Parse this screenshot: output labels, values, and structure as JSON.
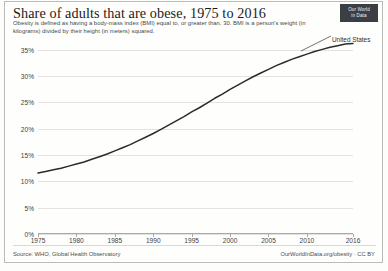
{
  "chart_data": {
    "type": "line",
    "title": "Share of adults that are obese, 1975 to 2016",
    "subtitle": "Obesity is defined as having a body-mass index (BMI) equal to, or greater than, 30. BMI is a person's weight (in kilograms) divided by their height (in meters) squared.",
    "xlabel": "",
    "ylabel": "",
    "xlim": [
      1975,
      2016
    ],
    "ylim": [
      0,
      36.5
    ],
    "grid": true,
    "legend_position": "inline-right-end",
    "x_tick_labels": [
      "1975",
      "1980",
      "1985",
      "1990",
      "1995",
      "2000",
      "2005",
      "2010",
      "2016"
    ],
    "x_ticks": [
      1975,
      1980,
      1985,
      1990,
      1995,
      2000,
      2005,
      2010,
      2016
    ],
    "y_tick_labels": [
      "0%",
      "5%",
      "10%",
      "15%",
      "20%",
      "25%",
      "30%",
      "35%"
    ],
    "y_ticks": [
      0,
      5,
      10,
      15,
      20,
      25,
      30,
      35
    ],
    "series": [
      {
        "name": "United States",
        "color": "#2b2b2b",
        "x": [
          1975,
          1976,
          1977,
          1978,
          1979,
          1980,
          1981,
          1982,
          1983,
          1984,
          1985,
          1986,
          1987,
          1988,
          1989,
          1990,
          1991,
          1992,
          1993,
          1994,
          1995,
          1996,
          1997,
          1998,
          1999,
          2000,
          2001,
          2002,
          2003,
          2004,
          2005,
          2006,
          2007,
          2008,
          2009,
          2010,
          2011,
          2012,
          2013,
          2014,
          2015,
          2016
        ],
        "values": [
          11.6,
          11.9,
          12.2,
          12.5,
          12.9,
          13.3,
          13.7,
          14.2,
          14.7,
          15.2,
          15.8,
          16.4,
          17.0,
          17.7,
          18.4,
          19.1,
          19.9,
          20.7,
          21.5,
          22.3,
          23.2,
          24.0,
          24.9,
          25.8,
          26.6,
          27.5,
          28.3,
          29.1,
          29.9,
          30.6,
          31.3,
          32.0,
          32.6,
          33.2,
          33.7,
          34.2,
          34.7,
          35.1,
          35.5,
          35.8,
          36.1,
          36.2
        ]
      }
    ]
  },
  "logo": {
    "line1": "Our World",
    "line2": "in Data"
  },
  "footer": {
    "source": "Source: WHO, Global Health Observatory",
    "attribution": "OurWorldInData.org/obesity · CC BY"
  }
}
